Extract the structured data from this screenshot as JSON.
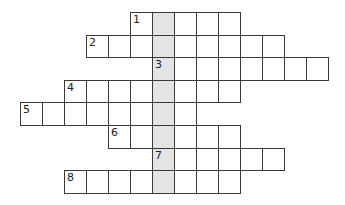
{
  "puzzle": {
    "type": "crossword",
    "cell_size": 22,
    "origin": {
      "x": 20,
      "y": 12
    },
    "row_height": 22.6,
    "shaded_column": 6,
    "colors": {
      "line": "#3a3a3a",
      "shaded": "#e4e4e4",
      "background": "#ffffff"
    },
    "rows": [
      {
        "number": "1",
        "start_col": 5,
        "length": 5
      },
      {
        "number": "2",
        "start_col": 3,
        "length": 9
      },
      {
        "number": "3",
        "start_col": 6,
        "length": 8
      },
      {
        "number": "4",
        "start_col": 2,
        "length": 8
      },
      {
        "number": "5",
        "start_col": 0,
        "length": 8
      },
      {
        "number": "6",
        "start_col": 4,
        "length": 6
      },
      {
        "number": "7",
        "start_col": 6,
        "length": 6
      },
      {
        "number": "8",
        "start_col": 2,
        "length": 8
      }
    ]
  }
}
